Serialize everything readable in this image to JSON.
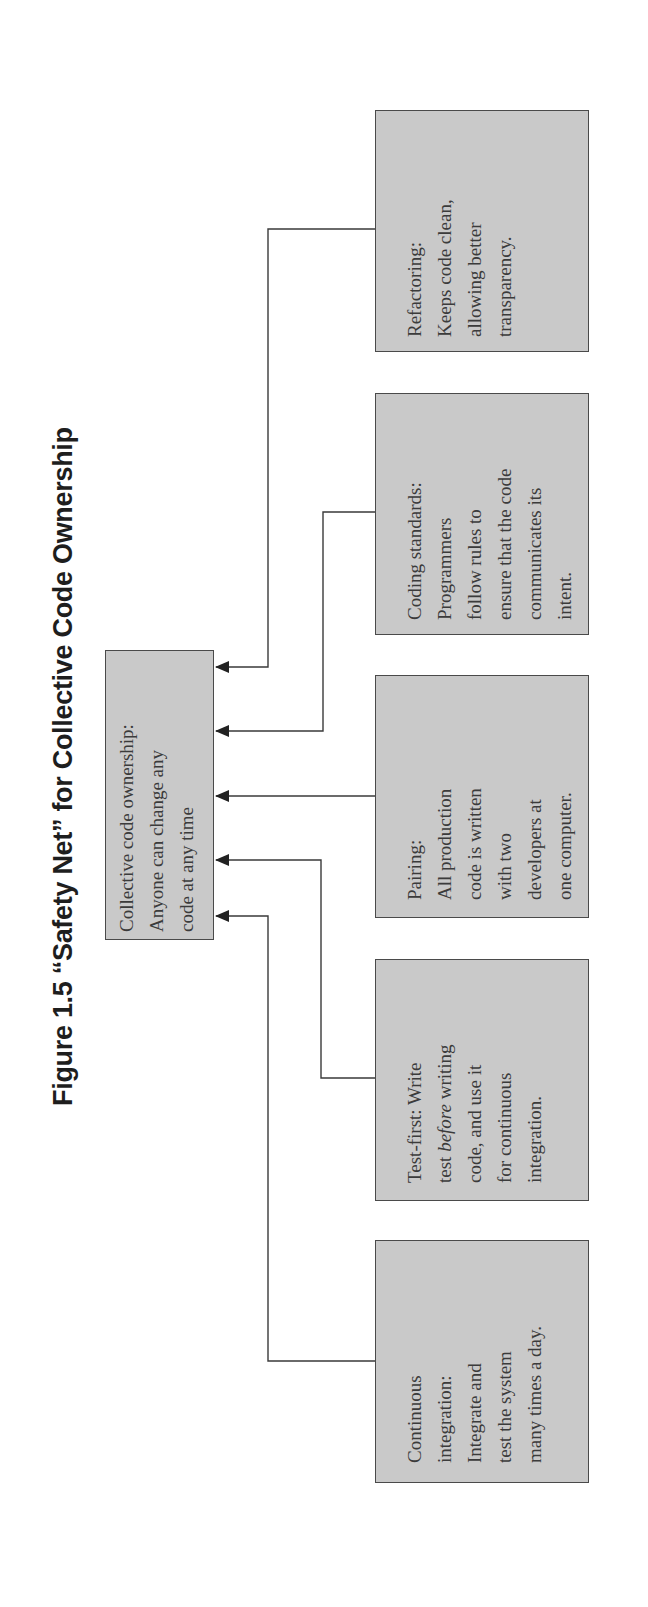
{
  "figure": {
    "title": "Figure 1.5 “Safety Net” for Collective Code Ownership",
    "orientation": "rotated 90° counterclockwise",
    "colors": {
      "box_fill": "#c9c9c9",
      "box_border": "#4a4a4a",
      "text": "#3b3b3b",
      "connector": "#3a3a3a"
    }
  },
  "center_node": {
    "lines": [
      "Collective code ownership:",
      "Anyone can change any",
      "code at any time"
    ]
  },
  "practices": [
    {
      "name": "Continuous integration",
      "lines": [
        "Continuous",
        "integration:",
        "Integrate and",
        "test the system",
        "many times a day."
      ]
    },
    {
      "name": "Test-first",
      "lines": [
        "Test-first: Write",
        "test before writing",
        "code, and use it",
        "for continuous",
        "integration."
      ],
      "emphasis": "before"
    },
    {
      "name": "Pairing",
      "lines": [
        "Pairing:",
        "All production",
        "code is written",
        "with two",
        "developers at",
        "one computer."
      ]
    },
    {
      "name": "Coding standards",
      "lines": [
        "Coding standards:",
        "Programmers",
        "follow rules to",
        "ensure that the code",
        "communicates its",
        "intent."
      ]
    },
    {
      "name": "Refactoring",
      "lines": [
        "Refactoring:",
        "Keeps code clean,",
        "allowing better",
        "transparency."
      ]
    }
  ],
  "test_first_parts": {
    "prefix": "test ",
    "emph": "before",
    "suffix": " writing"
  }
}
